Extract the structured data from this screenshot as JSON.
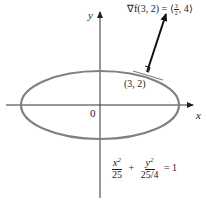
{
  "diagram": {
    "axes": {
      "x_label": "x",
      "y_label": "y",
      "origin_label": "0"
    },
    "ellipse": {
      "a": 5,
      "b": 2.5,
      "equation": {
        "term1_num": "x",
        "term1_num_exp": "2",
        "term1_den": "25",
        "plus": "+",
        "term2_num": "y",
        "term2_num_exp": "2",
        "term2_den": "25/4",
        "rhs": "= 1"
      },
      "color": "#808080"
    },
    "point": {
      "label": "(3, 2)"
    },
    "gradient": {
      "label_prefix": "∇f(3, 2) = ⟨",
      "frac_num": "3",
      "frac_den": "2",
      "label_suffix": ", 4⟩",
      "color": "#111111"
    },
    "colors": {
      "axis": "#333333",
      "ellipse": "#808080",
      "tangent": "#808080",
      "arrow": "#111111"
    }
  }
}
